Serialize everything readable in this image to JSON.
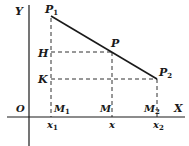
{
  "diagram": {
    "type": "coordinate-geometry",
    "axes": {
      "x_label": "X",
      "y_label": "Y",
      "origin_label": "O"
    },
    "points": [
      {
        "id": "P1",
        "label": "P",
        "sub": "1"
      },
      {
        "id": "P",
        "label": "P",
        "sub": ""
      },
      {
        "id": "P2",
        "label": "P",
        "sub": "2"
      }
    ],
    "y_projections": [
      {
        "label": "H",
        "sub": ""
      },
      {
        "label": "K",
        "sub": ""
      }
    ],
    "x_projections": [
      {
        "label": "M",
        "sub": "1"
      },
      {
        "label": "M",
        "sub": ""
      },
      {
        "label": "M",
        "sub": "2"
      }
    ],
    "x_ticks": [
      {
        "label": "x",
        "sub": "1"
      },
      {
        "label": "x",
        "sub": ""
      },
      {
        "label": "x",
        "sub": "2"
      }
    ],
    "colors": {
      "ink": "#1a1a1a",
      "background": "#ffffff"
    }
  }
}
